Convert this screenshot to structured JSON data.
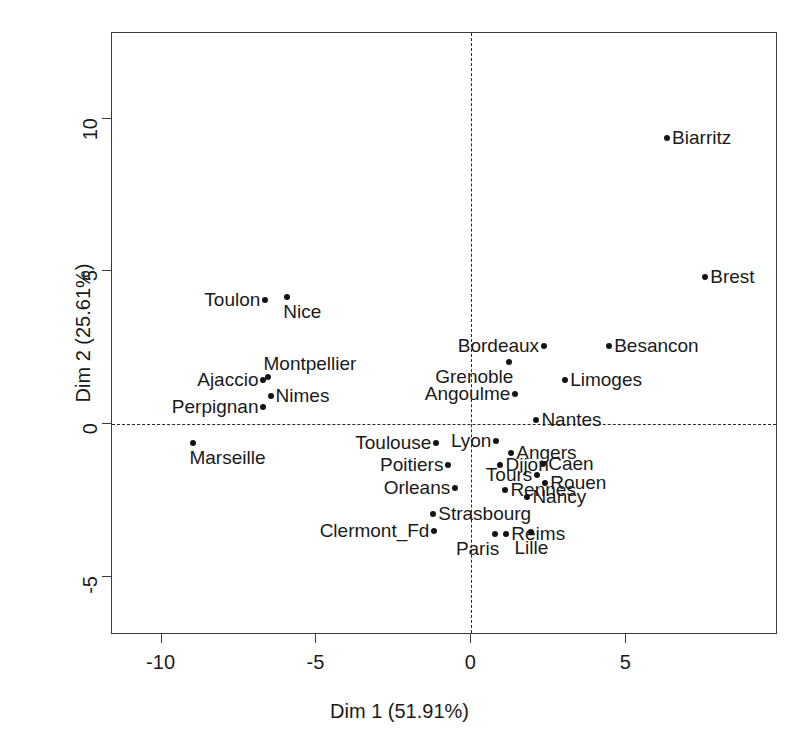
{
  "chart_data": {
    "type": "scatter",
    "title": "",
    "xlabel": "Dim 1 (51.91%)",
    "ylabel": "Dim 2 (25.61%)",
    "xlim": [
      -11.6,
      9.9
    ],
    "ylim": [
      -6.9,
      12.8
    ],
    "xticks": [
      -10,
      -5,
      0,
      5
    ],
    "yticks": [
      10,
      5,
      0,
      -5
    ],
    "xtick_labels": [
      "-10",
      "-5",
      "0",
      "5"
    ],
    "ytick_labels": [
      "10",
      "5",
      "0",
      "-5"
    ],
    "grid": false,
    "legend": "none",
    "reference_lines": {
      "vertical_x": 0,
      "horizontal_y": 0,
      "style": "dashed"
    },
    "point_marker": "filled-circle",
    "points": [
      {
        "label": "Biarritz",
        "x": 6.32,
        "y": 9.35,
        "pos": "lab-r"
      },
      {
        "label": "Brest",
        "x": 7.55,
        "y": 4.8,
        "pos": "lab-r"
      },
      {
        "label": "Toulon",
        "x": -6.65,
        "y": 4.05,
        "pos": "lab-l"
      },
      {
        "label": "Nice",
        "x": -5.94,
        "y": 4.17,
        "pos": "lab-br"
      },
      {
        "label": "Besancon",
        "x": 4.45,
        "y": 2.56,
        "pos": "lab-r"
      },
      {
        "label": "Bordeaux",
        "x": 2.35,
        "y": 2.56,
        "pos": "lab-l"
      },
      {
        "label": "Grenoble",
        "x": 1.23,
        "y": 2.05,
        "pos": "lab-bl"
      },
      {
        "label": "Limoges",
        "x": 3.03,
        "y": 1.46,
        "pos": "lab-r"
      },
      {
        "label": "Montpellier",
        "x": -6.58,
        "y": 1.54,
        "pos": "lab-tr"
      },
      {
        "label": "Ajaccio",
        "x": -6.71,
        "y": 1.46,
        "pos": "lab-l"
      },
      {
        "label": "Angoulme",
        "x": 1.42,
        "y": 0.98,
        "pos": "lab-l"
      },
      {
        "label": "Nimes",
        "x": -6.48,
        "y": 0.91,
        "pos": "lab-r"
      },
      {
        "label": "Perpignan",
        "x": -6.71,
        "y": 0.55,
        "pos": "lab-l"
      },
      {
        "label": "Nantes",
        "x": 2.1,
        "y": 0.12,
        "pos": "lab-r"
      },
      {
        "label": "Lyon",
        "x": 0.81,
        "y": -0.55,
        "pos": "lab-l"
      },
      {
        "label": "Angers",
        "x": 1.29,
        "y": -0.94,
        "pos": "lab-r"
      },
      {
        "label": "Toulouse",
        "x": -1.13,
        "y": -0.63,
        "pos": "lab-l"
      },
      {
        "label": "Marseille",
        "x": -8.97,
        "y": -0.63,
        "pos": "lab-br"
      },
      {
        "label": "Caen",
        "x": 2.32,
        "y": -1.3,
        "pos": "lab-r"
      },
      {
        "label": "Poitiers",
        "x": -0.74,
        "y": -1.34,
        "pos": "lab-l"
      },
      {
        "label": "Dijon",
        "x": 0.94,
        "y": -1.34,
        "pos": "lab-r"
      },
      {
        "label": "Tours",
        "x": 2.13,
        "y": -1.65,
        "pos": "lab-l"
      },
      {
        "label": "Rouen",
        "x": 2.39,
        "y": -1.93,
        "pos": "lab-r"
      },
      {
        "label": "Orleans",
        "x": -0.52,
        "y": -2.09,
        "pos": "lab-l"
      },
      {
        "label": "Rennes",
        "x": 1.1,
        "y": -2.17,
        "pos": "lab-r"
      },
      {
        "label": "Nancy",
        "x": 1.81,
        "y": -2.4,
        "pos": "lab-r"
      },
      {
        "label": "Strasbourg",
        "x": -1.23,
        "y": -2.95,
        "pos": "lab-r"
      },
      {
        "label": "Clermont_Fd",
        "x": -1.19,
        "y": -3.5,
        "pos": "lab-l"
      },
      {
        "label": "Paris",
        "x": 0.77,
        "y": -3.58,
        "pos": "lab-bl"
      },
      {
        "label": "Reims",
        "x": 1.13,
        "y": -3.58,
        "pos": "lab-r"
      },
      {
        "label": "Lille",
        "x": 1.94,
        "y": -3.54,
        "pos": "lab-b"
      }
    ]
  }
}
